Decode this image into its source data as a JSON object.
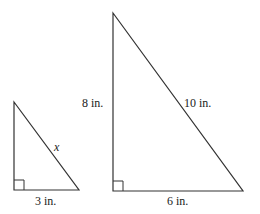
{
  "small_triangle": {
    "hypotenuse_label": "x",
    "base_label": "3 in."
  },
  "large_triangle": {
    "height_label": "8 in.",
    "hypotenuse_label": "10 in.",
    "base_label": "6 in."
  }
}
